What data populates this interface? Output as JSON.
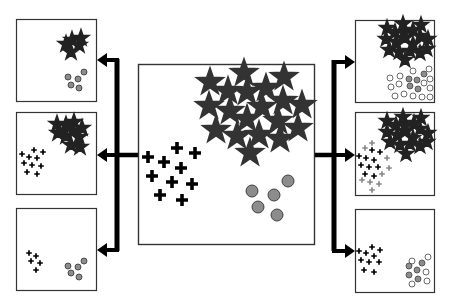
{
  "diagram": {
    "title": "",
    "colors": {
      "stroke": "#222222",
      "arrow": "#000000",
      "star_fill_center": "#e6e6e6",
      "star_fill_small": "#ffffff",
      "circle_fill": "#8c8c8c",
      "circle_hollow": "#ffffff",
      "cross_dark": "#000000",
      "cross_light": "#888888"
    },
    "center_box": {
      "label": "source-dataset",
      "clusters": [
        "stars",
        "crosses",
        "circles"
      ]
    },
    "left_boxes": [
      {
        "label": "subset-stars-circles",
        "clusters": [
          "stars",
          "circles"
        ]
      },
      {
        "label": "subset-stars-crosses",
        "clusters": [
          "stars",
          "crosses"
        ]
      },
      {
        "label": "subset-crosses-circles",
        "clusters": [
          "crosses",
          "circles"
        ]
      }
    ],
    "right_boxes": [
      {
        "label": "augmented-stars-circles",
        "clusters": [
          "stars",
          "circles",
          "new-hollow-circles"
        ]
      },
      {
        "label": "augmented-stars-crosses",
        "clusters": [
          "stars",
          "crosses",
          "new-gray-crosses"
        ]
      },
      {
        "label": "augmented-crosses-circles",
        "clusters": [
          "crosses",
          "circles",
          "new-hollow-circles"
        ]
      }
    ]
  }
}
